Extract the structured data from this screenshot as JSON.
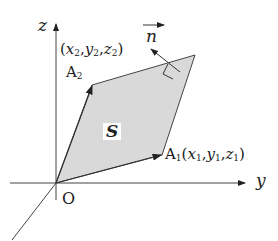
{
  "diagram": {
    "axes": {
      "z_label": "z",
      "y_label": "y",
      "origin_label": "O"
    },
    "points": {
      "A1": {
        "name": "A",
        "sub": "1",
        "coords": [
          "x",
          "1",
          "y",
          "1",
          "z",
          "1"
        ],
        "coord_text": "(x1,y1,z1)"
      },
      "A2": {
        "name": "A",
        "sub": "2",
        "coords": [
          "x",
          "2",
          "y",
          "2",
          "z",
          "2"
        ],
        "coord_text": "(x2,y2,z2)"
      }
    },
    "area_label": "S",
    "normal_label": "n",
    "colors": {
      "fill": "#d9d9d9",
      "stroke": "#333333"
    }
  }
}
